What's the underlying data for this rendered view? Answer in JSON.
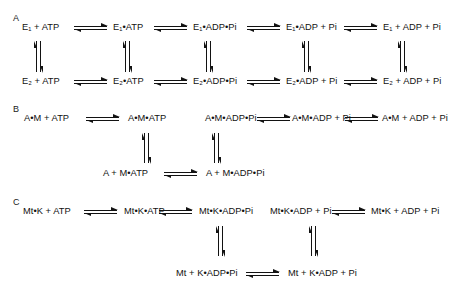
{
  "page_header": "",
  "diagram": {
    "panels": [
      {
        "id": "A",
        "letter": "A",
        "rows": [
          {
            "id": "A-top",
            "terms": [
              "E₁ + ATP",
              "E₁•ATP",
              "E₁•ADP•Pi",
              "E₁•ADP + Pi",
              "E₁ + ADP + Pi"
            ]
          },
          {
            "id": "A-bottom",
            "terms": [
              "E₂ + ATP",
              "E₂•ATP",
              "E₂•ADP•Pi",
              "E₂•ADP + Pi",
              "E₂ + ADP + Pi"
            ]
          }
        ],
        "horizontal_arrows": 8,
        "vertical_arrows": 5,
        "arrow_type": "equilibrium-double-harpoon"
      },
      {
        "id": "B",
        "letter": "B",
        "rows": [
          {
            "id": "B-top",
            "terms": [
              "A•M + ATP",
              "A•M•ATP",
              "A•M•ADP•Pi",
              "A•M•ADP + Pi",
              "A•M + ADP + Pi"
            ]
          },
          {
            "id": "B-bottom",
            "terms": [
              "A + M•ATP",
              "A + M•ADP•Pi"
            ]
          }
        ],
        "horizontal_arrows": 4,
        "vertical_arrows": 2,
        "arrow_type": "equilibrium-double-harpoon"
      },
      {
        "id": "C",
        "letter": "C",
        "rows": [
          {
            "id": "C-top",
            "terms": [
              "Mt•K + ATP",
              "Mt•K•ATP",
              "Mt•K•ADP•Pi",
              "Mt•K•ADP + Pi",
              "Mt•K + ADP + Pi"
            ]
          },
          {
            "id": "C-bottom",
            "terms": [
              "Mt + K•ADP•Pi",
              "Mt + K•ADP + Pi"
            ]
          }
        ],
        "horizontal_arrows": 4,
        "vertical_arrows": 2,
        "arrow_type": "equilibrium-double-harpoon"
      }
    ]
  },
  "colors": {
    "ink": "#121212",
    "background": "#ffffff",
    "faint_header": "#d2d2d2"
  }
}
